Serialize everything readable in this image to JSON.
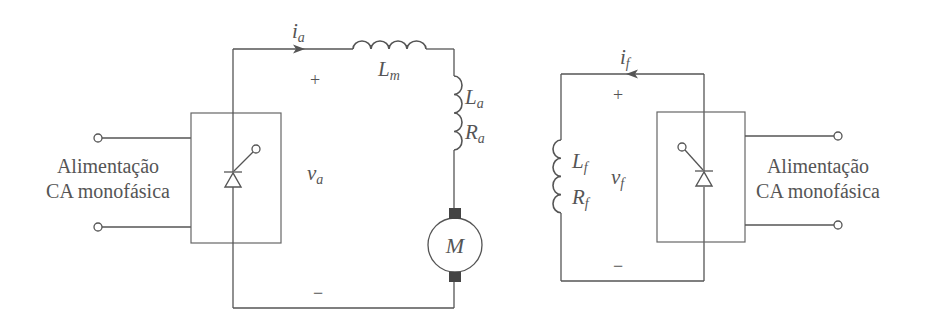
{
  "diagram": {
    "type": "circuit-schematic",
    "colors": {
      "line": "#555555",
      "text": "#555555",
      "brush": "#444444",
      "background": "#ffffff"
    },
    "armature_circuit": {
      "supply_label_line1": "Alimentação",
      "supply_label_line2": "CA monofásica",
      "current_symbol": "i",
      "current_sub": "a",
      "voltage_symbol": "v",
      "voltage_sub": "a",
      "plus": "+",
      "minus": "−",
      "inductor_m_symbol": "L",
      "inductor_m_sub": "m",
      "inductor_a_symbol": "L",
      "inductor_a_sub": "a",
      "resistor_a_symbol": "R",
      "resistor_a_sub": "a",
      "motor_label": "M",
      "converter": "thyristor-controlled rectifier"
    },
    "field_circuit": {
      "supply_label_line1": "Alimentação",
      "supply_label_line2": "CA monofásica",
      "current_symbol": "i",
      "current_sub": "f",
      "voltage_symbol": "v",
      "voltage_sub": "f",
      "plus": "+",
      "minus": "−",
      "inductor_f_symbol": "L",
      "inductor_f_sub": "f",
      "resistor_f_symbol": "R",
      "resistor_f_sub": "f",
      "converter": "thyristor-controlled rectifier"
    }
  }
}
